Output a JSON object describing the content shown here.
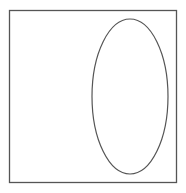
{
  "canvas": {
    "width": 186,
    "height": 193,
    "background": "#ffffff"
  },
  "shapes": {
    "square": {
      "x": 9.5,
      "y": 10.5,
      "width": 167,
      "height": 172,
      "stroke": "#555555",
      "stroke_width": 1.3
    },
    "ellipse": {
      "cx": 130,
      "cy": 96.5,
      "rx": 38,
      "ry": 77.5,
      "stroke": "#555555",
      "stroke_width": 1.2
    }
  }
}
